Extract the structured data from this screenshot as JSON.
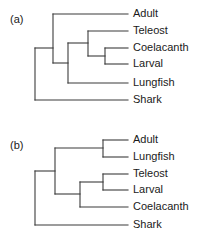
{
  "figure": {
    "background_color": "#ffffff",
    "line_color": "#3b3b3b",
    "text_color": "#1a1a1a",
    "width": 202,
    "height": 241
  },
  "panels": [
    {
      "id": "a",
      "label": "(a)",
      "label_x": 10,
      "label_y": 20,
      "leaves": [
        {
          "name": "Adult",
          "label": "Adult",
          "x_tip": 128,
          "y": 14,
          "label_x": 133
        },
        {
          "name": "Teleost",
          "label": "Teleost",
          "x_tip": 128,
          "y": 31,
          "label_x": 133
        },
        {
          "name": "Coelacanth",
          "label": "Coelacanth",
          "x_tip": 128,
          "y": 48,
          "label_x": 133
        },
        {
          "name": "Larval",
          "label": "Larval",
          "x_tip": 128,
          "y": 64,
          "label_x": 133
        },
        {
          "name": "Lungfish",
          "label": "Lungfish",
          "x_tip": 128,
          "y": 83,
          "label_x": 133
        },
        {
          "name": "Shark",
          "label": "Shark",
          "x_tip": 128,
          "y": 100,
          "label_x": 133
        }
      ],
      "newick": "(Shark,((Adult,(Teleost,(Coelacanth,Larval))),Lungfish));",
      "horizontals": [
        {
          "name": "branch-adult",
          "x1": 53,
          "x2": 128,
          "y": 14
        },
        {
          "name": "branch-teleost",
          "x1": 88,
          "x2": 128,
          "y": 31
        },
        {
          "name": "branch-coelacanth",
          "x1": 105,
          "x2": 128,
          "y": 48
        },
        {
          "name": "branch-larval",
          "x1": 105,
          "x2": 128,
          "y": 64
        },
        {
          "name": "branch-lungfish",
          "x1": 68,
          "x2": 128,
          "y": 83
        },
        {
          "name": "branch-shark",
          "x1": 35,
          "x2": 128,
          "y": 100
        },
        {
          "name": "branch-node-coelacanth-larval",
          "x1": 88,
          "x2": 105,
          "y": 56
        },
        {
          "name": "branch-node-teleost-clade",
          "x1": 68,
          "x2": 88,
          "y": 43
        },
        {
          "name": "branch-node-adult-clade",
          "x1": 53,
          "x2": 68,
          "y": 63
        },
        {
          "name": "branch-node-root",
          "x1": 35,
          "x2": 53,
          "y": 48
        }
      ],
      "verticals": [
        {
          "name": "node-coelacanth-larval",
          "x": 105,
          "y1": 48,
          "y2": 64
        },
        {
          "name": "node-teleost-clade",
          "x": 88,
          "y1": 31,
          "y2": 56
        },
        {
          "name": "node-adult-clade",
          "x": 68,
          "y1": 43,
          "y2": 83
        },
        {
          "name": "node-inner",
          "x": 53,
          "y1": 14,
          "y2": 63
        },
        {
          "name": "node-root",
          "x": 35,
          "y1": 48,
          "y2": 100
        }
      ]
    },
    {
      "id": "b",
      "label": "(b)",
      "label_x": 10,
      "label_y": 146,
      "leaves": [
        {
          "name": "Adult",
          "label": "Adult",
          "x_tip": 128,
          "y": 140,
          "label_x": 133
        },
        {
          "name": "Lungfish",
          "label": "Lungfish",
          "x_tip": 128,
          "y": 157,
          "label_x": 133
        },
        {
          "name": "Teleost",
          "label": "Teleost",
          "x_tip": 128,
          "y": 174,
          "label_x": 133
        },
        {
          "name": "Larval",
          "label": "Larval",
          "x_tip": 128,
          "y": 190,
          "label_x": 133
        },
        {
          "name": "Coelacanth",
          "label": "Coelacanth",
          "x_tip": 128,
          "y": 207,
          "label_x": 133
        },
        {
          "name": "Shark",
          "label": "Shark",
          "x_tip": 128,
          "y": 225,
          "label_x": 133
        }
      ],
      "newick": "(Shark,((Adult,Lungfish),((Teleost,Larval),Coelacanth)));",
      "horizontals": [
        {
          "name": "branch-adult",
          "x1": 103,
          "x2": 128,
          "y": 140
        },
        {
          "name": "branch-lungfish",
          "x1": 103,
          "x2": 128,
          "y": 157
        },
        {
          "name": "branch-teleost",
          "x1": 103,
          "x2": 128,
          "y": 174
        },
        {
          "name": "branch-larval",
          "x1": 103,
          "x2": 128,
          "y": 190
        },
        {
          "name": "branch-coelacanth",
          "x1": 80,
          "x2": 128,
          "y": 207
        },
        {
          "name": "branch-shark",
          "x1": 35,
          "x2": 128,
          "y": 225
        },
        {
          "name": "branch-node-adult-lungfish",
          "x1": 55,
          "x2": 103,
          "y": 148
        },
        {
          "name": "branch-node-teleost-larval",
          "x1": 80,
          "x2": 103,
          "y": 182
        },
        {
          "name": "branch-node-fish-clade",
          "x1": 55,
          "x2": 80,
          "y": 194
        },
        {
          "name": "branch-node-root",
          "x1": 35,
          "x2": 55,
          "y": 171
        }
      ],
      "verticals": [
        {
          "name": "node-adult-lungfish",
          "x": 103,
          "y1": 140,
          "y2": 157
        },
        {
          "name": "node-teleost-larval",
          "x": 103,
          "y1": 174,
          "y2": 190
        },
        {
          "name": "node-fish-clade",
          "x": 80,
          "y1": 182,
          "y2": 207
        },
        {
          "name": "node-inner",
          "x": 55,
          "y1": 148,
          "y2": 194
        },
        {
          "name": "node-root",
          "x": 35,
          "y1": 171,
          "y2": 225
        }
      ]
    }
  ]
}
